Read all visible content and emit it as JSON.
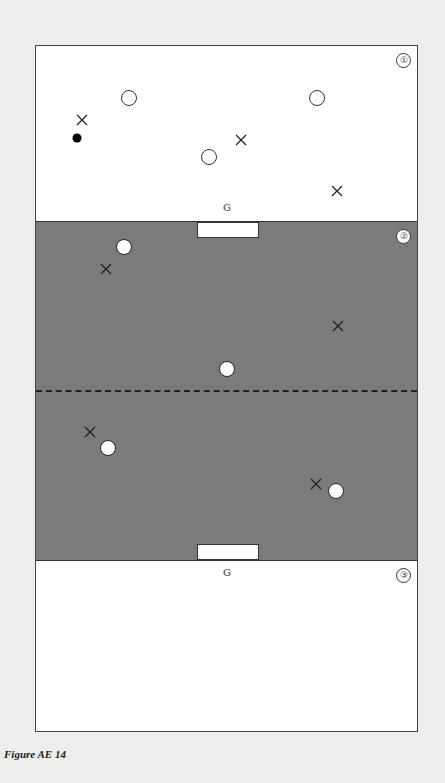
{
  "diagram": {
    "caption": "Figure AE 14",
    "zones": [
      {
        "id": "1",
        "label": "①",
        "shade": "#ffffff"
      },
      {
        "id": "2",
        "label": "②",
        "shade": "#7b7b7b"
      },
      {
        "id": "3",
        "label": "③",
        "shade": "#ffffff"
      }
    ],
    "goal_labels": {
      "top": "G",
      "bottom": "G"
    },
    "markers": {
      "zone1": [
        {
          "type": "cross",
          "x": 82,
          "y": 117
        },
        {
          "type": "ball",
          "x": 77,
          "y": 138
        },
        {
          "type": "open-circle",
          "x": 129,
          "y": 98
        },
        {
          "type": "open-circle",
          "x": 317,
          "y": 98
        },
        {
          "type": "cross",
          "x": 241,
          "y": 137
        },
        {
          "type": "open-circle",
          "x": 209,
          "y": 157
        },
        {
          "type": "cross",
          "x": 337,
          "y": 188
        }
      ],
      "zone2": [
        {
          "type": "white-circle",
          "x": 124,
          "y": 247
        },
        {
          "type": "cross",
          "x": 106,
          "y": 266
        },
        {
          "type": "cross",
          "x": 338,
          "y": 323
        },
        {
          "type": "white-circle",
          "x": 227,
          "y": 369
        },
        {
          "type": "cross",
          "x": 90,
          "y": 429
        },
        {
          "type": "white-circle",
          "x": 108,
          "y": 448
        },
        {
          "type": "cross",
          "x": 316,
          "y": 481
        },
        {
          "type": "white-circle",
          "x": 336,
          "y": 491
        }
      ]
    }
  }
}
